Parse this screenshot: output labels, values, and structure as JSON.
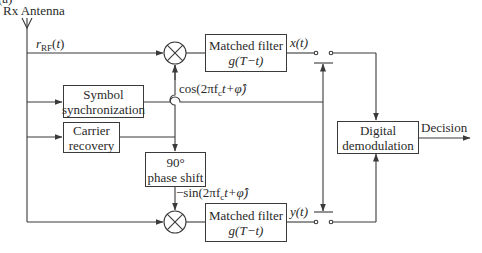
{
  "title_fragment": "(a)",
  "antenna": {
    "label": "Rx Antenna"
  },
  "signals": {
    "rf_input": {
      "var": "r",
      "sub": "RF",
      "arg": "(t)"
    },
    "cos_ref": "cos(2πf",
    "cos_ref_sub": "c",
    "cos_ref_tail": "t+φ̂)",
    "sin_ref": "−sin(2πf",
    "sin_ref_sub": "c",
    "sin_ref_tail": "t+φ̂)",
    "x_out": "x(t)",
    "y_out": "y(t)",
    "decision": "Decision"
  },
  "blocks": {
    "matched_filter_top": {
      "line1": "Matched filter",
      "line2": "g(T−t)"
    },
    "matched_filter_bottom": {
      "line1": "Matched filter",
      "line2": "g(T−t)"
    },
    "symbol_sync": {
      "line1": "Symbol",
      "line2": "synchronization"
    },
    "carrier_recovery": {
      "line1": "Carrier",
      "line2": "recovery"
    },
    "phase_shift": {
      "line1": "90°",
      "line2": "phase shift"
    },
    "digital_demod": {
      "line1": "Digital",
      "line2": "demodulation"
    }
  },
  "colors": {
    "line": "#3a3a3a",
    "text": "#2a2a2a",
    "background": "#ffffff"
  }
}
